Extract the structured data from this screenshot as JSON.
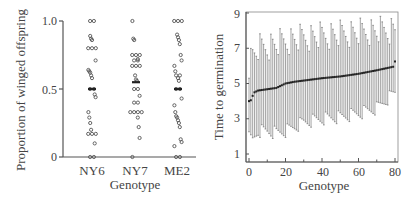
{
  "chart_data": [
    {
      "type": "scatter",
      "title": "",
      "xlabel": "Genotype",
      "ylabel": "Proportion of winged offspring",
      "categories": [
        "NY6",
        "NY7",
        "ME2"
      ],
      "yticks": [
        "0",
        "0.5",
        "1.0"
      ],
      "ytick_values": [
        0,
        0.5,
        1.0
      ],
      "ylim": [
        0,
        1.0
      ],
      "grid": false,
      "legend": null,
      "series": [
        {
          "name": "NY6",
          "mean": 0.5,
          "values": [
            1.0,
            1.0,
            0.89,
            0.87,
            0.86,
            0.8,
            0.8,
            0.8,
            0.71,
            0.64,
            0.63,
            0.62,
            0.6,
            0.58,
            0.5,
            0.5,
            0.46,
            0.44,
            0.33,
            0.29,
            0.25,
            0.2,
            0.17,
            0.17,
            0.17,
            0.1,
            0.0,
            0.0
          ]
        },
        {
          "name": "NY7",
          "mean": 0.55,
          "values": [
            1.0,
            0.87,
            0.86,
            0.75,
            0.75,
            0.75,
            0.72,
            0.71,
            0.71,
            0.67,
            0.67,
            0.67,
            0.6,
            0.57,
            0.56,
            0.5,
            0.5,
            0.45,
            0.4,
            0.4,
            0.33,
            0.33,
            0.33,
            0.33,
            0.29,
            0.22,
            0.14,
            0.0
          ]
        },
        {
          "name": "ME2",
          "mean": 0.5,
          "values": [
            1.0,
            1.0,
            1.0,
            0.9,
            0.88,
            0.86,
            0.83,
            0.75,
            0.71,
            0.67,
            0.63,
            0.6,
            0.6,
            0.58,
            0.56,
            0.5,
            0.5,
            0.43,
            0.38,
            0.33,
            0.3,
            0.29,
            0.27,
            0.25,
            0.22,
            0.13,
            0.11,
            0.08,
            0.0,
            0.0
          ]
        }
      ]
    },
    {
      "type": "line",
      "title": "",
      "xlabel": "Genotype",
      "ylabel": "Time to germination",
      "xticks": [
        "0",
        "20",
        "40",
        "60",
        "80"
      ],
      "xtick_values": [
        0,
        20,
        40,
        60,
        80
      ],
      "yticks": [
        "1",
        "3",
        "5",
        "7",
        "9"
      ],
      "ytick_values": [
        1,
        3,
        5,
        7,
        9
      ],
      "xlim": [
        -2,
        82
      ],
      "ylim": [
        0.5,
        9.2
      ],
      "grid": false,
      "legend": null,
      "description": "Genotype means sorted ascending with error bars (upper and lower whiskers)",
      "series": [
        {
          "name": "mean",
          "x_start": 0,
          "x_end": 80,
          "mean_start": 4.0,
          "mean_end": 6.25,
          "mean_anchors": [
            [
              0,
              4.0
            ],
            [
              1,
              4.05
            ],
            [
              2,
              4.3
            ],
            [
              3,
              4.5
            ],
            [
              5,
              4.6
            ],
            [
              15,
              4.75
            ],
            [
              20,
              5.0
            ],
            [
              25,
              5.1
            ],
            [
              40,
              5.3
            ],
            [
              50,
              5.4
            ],
            [
              60,
              5.55
            ],
            [
              65,
              5.65
            ],
            [
              70,
              5.75
            ],
            [
              79,
              5.95
            ],
            [
              80,
              6.25
            ]
          ],
          "upper_anchors": [
            [
              0,
              6.1
            ],
            [
              2,
              6.6
            ],
            [
              5,
              7.0
            ],
            [
              10,
              7.1
            ],
            [
              20,
              7.4
            ],
            [
              30,
              7.6
            ],
            [
              40,
              7.7
            ],
            [
              50,
              7.8
            ],
            [
              60,
              7.9
            ],
            [
              70,
              8.0
            ],
            [
              80,
              8.05
            ]
          ],
          "lower_anchors": [
            [
              0,
              1.9
            ],
            [
              2,
              1.8
            ],
            [
              5,
              2.3
            ],
            [
              10,
              2.3
            ],
            [
              15,
              2.2
            ],
            [
              20,
              2.3
            ],
            [
              30,
              2.8
            ],
            [
              40,
              3.0
            ],
            [
              50,
              3.1
            ],
            [
              60,
              3.3
            ],
            [
              70,
              3.6
            ],
            [
              80,
              4.5
            ]
          ]
        }
      ]
    }
  ],
  "left_chart": {
    "ylabel": "Proportion of winged offspring",
    "xlabel": "Genotype",
    "yticks": [
      "1.0",
      "0.5",
      "0"
    ],
    "categories": [
      "NY6",
      "NY7",
      "ME2"
    ]
  },
  "right_chart": {
    "ylabel": "Time to germination",
    "xlabel": "Genotype",
    "yticks": [
      "9",
      "7",
      "5",
      "3",
      "1"
    ],
    "xticks": [
      "0",
      "20",
      "40",
      "60",
      "80"
    ]
  },
  "colors": {
    "axis": "#555555",
    "text": "#444444",
    "marker": "#555555",
    "errorbar": "#9a9a9a",
    "mean": "#222222"
  }
}
